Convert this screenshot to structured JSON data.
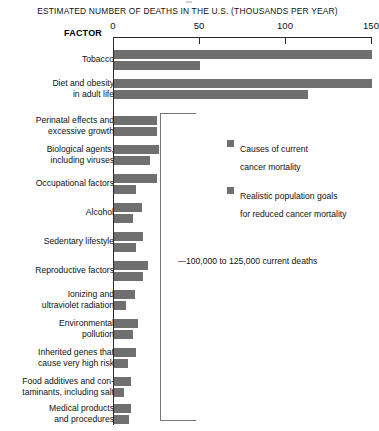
{
  "chart_data": {
    "type": "bar",
    "orientation": "horizontal",
    "title": "ESTIMATED NUMBER OF DEATHS IN THE U.S. (THOUSANDS PER YEAR)",
    "xlabel": "ESTIMATED NUMBER OF DEATHS IN THE U.S. (THOUSANDS PER YEAR)",
    "ylabel": "FACTOR",
    "xlim": [
      0,
      150
    ],
    "xticks": [
      0,
      50,
      100,
      150
    ],
    "xticklabels": [
      "0",
      "50",
      "100",
      "150"
    ],
    "grid": false,
    "legend_position": "middle-right",
    "categories": [
      "Tobacco",
      "Diet and obesity in adult life",
      "Perinatal effects and excessive growth",
      "Biological agents, including viruses",
      "Occupational factors",
      "Alcohol",
      "Sedentary lifestyle",
      "Reproductive factors",
      "Ionizing and ultraviolet radiation",
      "Environmental pollution",
      "Inherited genes that cause very high risk",
      "Food additives and contaminants, including salt",
      "Medical products and procedures"
    ],
    "series": [
      {
        "name": "Causes of current cancer mortality",
        "color": "#6f6f6f",
        "values": [
          150,
          150,
          25,
          26,
          25,
          16,
          17,
          20,
          12,
          14,
          13,
          10,
          10
        ]
      },
      {
        "name": "Realistic population goals for reduced cancer mortality",
        "color": "#6f6f6f",
        "values": [
          50,
          113,
          25,
          21,
          13,
          11,
          13,
          17,
          7,
          11,
          8,
          6,
          9
        ]
      }
    ],
    "annotations": [
      {
        "text": "100,000 to 125,000 current deaths",
        "target_categories_from": "Perinatal effects and excessive growth",
        "target_categories_to": "Medical products and procedures"
      }
    ]
  },
  "axis": {
    "title": "ESTIMATED NUMBER OF DEATHS IN THE U.S. (THOUSANDS PER YEAR)",
    "factor_header": "FACTOR",
    "ticks": [
      {
        "label": "0",
        "value": 0
      },
      {
        "label": "50",
        "value": 50
      },
      {
        "label": "100",
        "value": 100
      },
      {
        "label": "150",
        "value": 150
      }
    ]
  },
  "rows": [
    {
      "label": "Tobacco",
      "v1": 150,
      "v2": 50
    },
    {
      "label": "Diet and obesity\nin adult life",
      "v1": 150,
      "v2": 113
    },
    {
      "label": "Perinatal effects and\nexcessive growth",
      "v1": 25,
      "v2": 25
    },
    {
      "label": "Biological agents,\nincluding viruses",
      "v1": 26,
      "v2": 21
    },
    {
      "label": "Occupational factors",
      "v1": 25,
      "v2": 13
    },
    {
      "label": "Alcohol",
      "v1": 16,
      "v2": 11
    },
    {
      "label": "Sedentary lifestyle",
      "v1": 17,
      "v2": 13
    },
    {
      "label": "Reproductive factors",
      "v1": 20,
      "v2": 17
    },
    {
      "label": "Ionizing and\nultraviolet radiation",
      "v1": 12,
      "v2": 7
    },
    {
      "label": "Environmental\npollution",
      "v1": 14,
      "v2": 11
    },
    {
      "label": "Inherited genes that\ncause very high risk",
      "v1": 13,
      "v2": 8
    },
    {
      "label": "Food additives and con-\ntaminants, including salt",
      "v1": 10,
      "v2": 6
    },
    {
      "label": "Medical products\nand procedures",
      "v1": 10,
      "v2": 9
    }
  ],
  "legend": {
    "items": [
      {
        "text": "Causes of current\ncancer mortality",
        "color": "#6f6f6f"
      },
      {
        "text": "Realistic population goals\nfor reduced cancer mortality",
        "color": "#6f6f6f"
      }
    ]
  },
  "annotation": {
    "text": "100,000 to 125,000 current deaths"
  },
  "colors": {
    "bar": "#6f6f6f",
    "axis": "#2b2b2b",
    "bracket": "#777777",
    "background": "#ffffff"
  }
}
